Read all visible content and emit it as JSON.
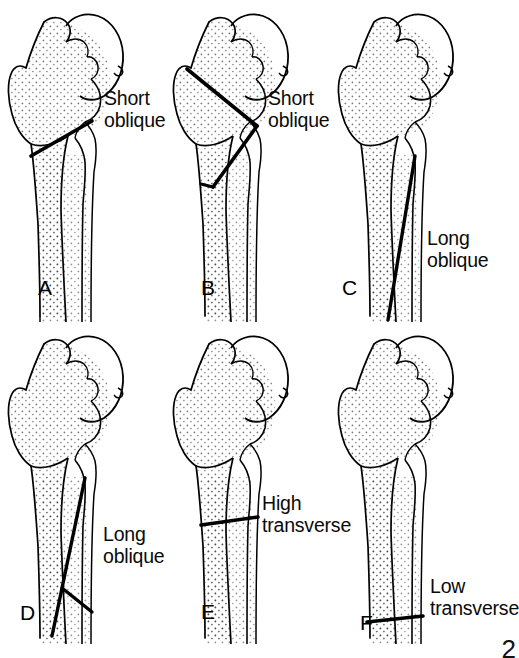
{
  "figure": {
    "background_color": "#ffffff",
    "line_color": "#000000",
    "stipple_color": "#2b2b2b",
    "corner_mark": "2"
  },
  "panels": [
    {
      "letter": "A",
      "label": "Short\noblique",
      "label_line1": "Short",
      "label_line2": "oblique",
      "fracture_type": "short oblique",
      "fracture_location": "subtrochanteric",
      "row": 1,
      "column": 1
    },
    {
      "letter": "B",
      "label": "Short\noblique",
      "label_line1": "Short",
      "label_line2": "oblique",
      "fracture_type": "short oblique",
      "fracture_location": "intertrochanteric with reverse obliquity",
      "row": 1,
      "column": 2
    },
    {
      "letter": "C",
      "label": "Long\noblique",
      "label_line1": "Long",
      "label_line2": "oblique",
      "fracture_type": "long oblique",
      "fracture_location": "subtrochanteric extending distally",
      "row": 1,
      "column": 3
    },
    {
      "letter": "D",
      "label": "Long\noblique",
      "label_line1": "Long",
      "label_line2": "oblique",
      "fracture_type": "long oblique with butterfly fragment",
      "fracture_location": "subtrochanteric extending distally",
      "row": 2,
      "column": 1
    },
    {
      "letter": "E",
      "label": "High\ntransverse",
      "label_line1": "High",
      "label_line2": "transverse",
      "fracture_type": "transverse",
      "fracture_location": "high subtrochanteric",
      "row": 2,
      "column": 2
    },
    {
      "letter": "F",
      "label": "Low\ntransverse",
      "label_line1": "Low",
      "label_line2": "transverse",
      "fracture_type": "transverse",
      "fracture_location": "low subtrochanteric",
      "row": 2,
      "column": 3
    }
  ]
}
